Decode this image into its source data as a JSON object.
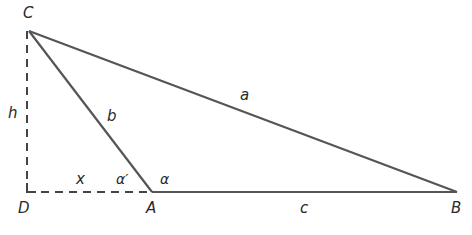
{
  "diagram": {
    "type": "triangle-with-altitude",
    "colors": {
      "stroke": "#555555",
      "text": "#2a2a2a",
      "background": "#ffffff"
    },
    "vertices": [
      {
        "id": "C",
        "label": "C",
        "x": 29,
        "y": 31
      },
      {
        "id": "D",
        "label": "D",
        "x": 27,
        "y": 192
      },
      {
        "id": "A",
        "label": "A",
        "x": 152,
        "y": 192
      },
      {
        "id": "B",
        "label": "B",
        "x": 457,
        "y": 192
      }
    ],
    "edges": [
      {
        "from": "C",
        "to": "B",
        "label": "a",
        "style": "solid"
      },
      {
        "from": "C",
        "to": "A",
        "label": "b",
        "style": "solid"
      },
      {
        "from": "A",
        "to": "B",
        "label": "c",
        "style": "solid"
      },
      {
        "from": "C",
        "to": "D",
        "label": "h",
        "style": "dashed"
      },
      {
        "from": "D",
        "to": "A",
        "label": "x",
        "style": "dashed"
      }
    ],
    "angles": [
      {
        "vertex": "A",
        "label": "α",
        "side": "interior"
      },
      {
        "vertex": "A",
        "label": "α′",
        "side": "exterior"
      }
    ],
    "labels": {
      "C": "C",
      "D": "D",
      "A": "A",
      "B": "B",
      "a": "a",
      "b": "b",
      "c": "c",
      "h": "h",
      "x": "x",
      "alpha": "α",
      "alpha_prime": "α′"
    }
  }
}
